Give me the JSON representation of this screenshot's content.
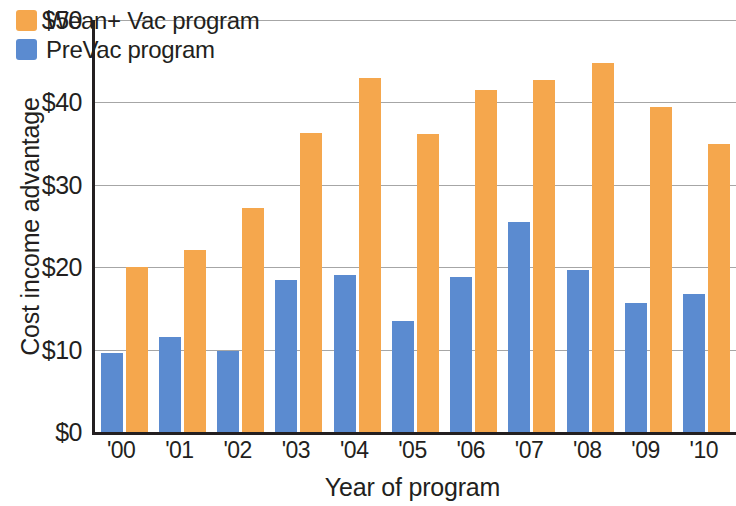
{
  "chart_data": {
    "type": "bar",
    "title": "",
    "xlabel": "Year of program",
    "ylabel": "Cost income advantage",
    "categories": [
      "'00",
      "'01",
      "'02",
      "'03",
      "'04",
      "'05",
      "'06",
      "'07",
      "'08",
      "'09",
      "'10"
    ],
    "series": [
      {
        "name": "PreVac program",
        "color": "#5b8bd0",
        "values": [
          9.6,
          11.5,
          9.8,
          18.5,
          19.0,
          13.5,
          18.8,
          25.5,
          19.7,
          15.7,
          16.7
        ]
      },
      {
        "name": "Wean+ Vac program",
        "color": "#f5a74d",
        "values": [
          20.0,
          22.1,
          27.2,
          36.3,
          43.0,
          36.2,
          41.5,
          42.7,
          44.8,
          39.5,
          35.0
        ]
      }
    ],
    "ylim": [
      0,
      50
    ],
    "y_ticks": [
      0,
      10,
      20,
      30,
      40,
      50
    ],
    "y_tick_labels": [
      "$0",
      "$10",
      "$20",
      "$30",
      "$40",
      "$50"
    ],
    "grid": "horizontal",
    "legend_position": "top-left",
    "legend_order": [
      "Wean+ Vac program",
      "PreVac program"
    ],
    "bar_order_in_group": [
      "PreVac program",
      "Wean+ Vac program"
    ]
  },
  "legend": {
    "items": [
      {
        "label": "Wean+ Vac program",
        "color": "#f5a74d"
      },
      {
        "label": "PreVac program",
        "color": "#5b8bd0"
      }
    ]
  },
  "axes": {
    "y_title": "Cost income advantage",
    "x_title": "Year of program"
  },
  "colors": {
    "orange": "#f5a74d",
    "blue": "#5b8bd0",
    "axis": "#231f20",
    "gridline": "#a6a6a6",
    "background": "#ffffff"
  }
}
